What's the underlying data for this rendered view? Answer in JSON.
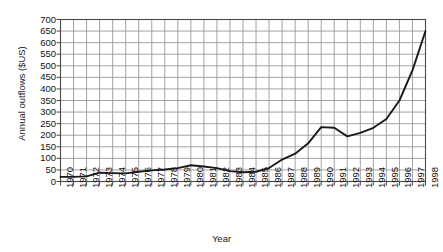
{
  "chart_data": {
    "type": "line",
    "title": "",
    "xlabel": "Year",
    "ylabel": "Annual outflows ($US)",
    "ylim": [
      0,
      700
    ],
    "ytick_step": 50,
    "yticks": [
      700,
      650,
      600,
      550,
      500,
      450,
      400,
      350,
      300,
      250,
      200,
      150,
      100,
      50,
      0
    ],
    "grid": true,
    "legend": null,
    "line_color": "#1a1a1a",
    "grid_color": "#9a9a9a",
    "background": "#ffffff",
    "categories": [
      "1970",
      "1971",
      "1972",
      "1973",
      "1974",
      "1975",
      "1976",
      "1977",
      "1978",
      "1979",
      "1980",
      "1981",
      "1982",
      "1983",
      "1984",
      "1985",
      "1986",
      "1987",
      "1988",
      "1989",
      "1990",
      "1991",
      "1992",
      "1993",
      "1994",
      "1995",
      "1996",
      "1997",
      "1998"
    ],
    "x": [
      1970,
      1971,
      1972,
      1973,
      1974,
      1975,
      1976,
      1977,
      1978,
      1979,
      1980,
      1981,
      1982,
      1983,
      1984,
      1985,
      1986,
      1987,
      1988,
      1989,
      1990,
      1991,
      1992,
      1993,
      1994,
      1995,
      1996,
      1997,
      1998
    ],
    "values": [
      20,
      20,
      22,
      38,
      36,
      35,
      42,
      48,
      52,
      58,
      70,
      65,
      58,
      45,
      40,
      42,
      58,
      95,
      120,
      165,
      235,
      232,
      195,
      210,
      232,
      270,
      350,
      480,
      650
    ],
    "series": [
      {
        "name": "Annual outflows",
        "values": [
          20,
          20,
          22,
          38,
          36,
          35,
          42,
          48,
          52,
          58,
          70,
          65,
          58,
          45,
          40,
          42,
          58,
          95,
          120,
          165,
          235,
          232,
          195,
          210,
          232,
          270,
          350,
          480,
          650
        ]
      }
    ]
  }
}
